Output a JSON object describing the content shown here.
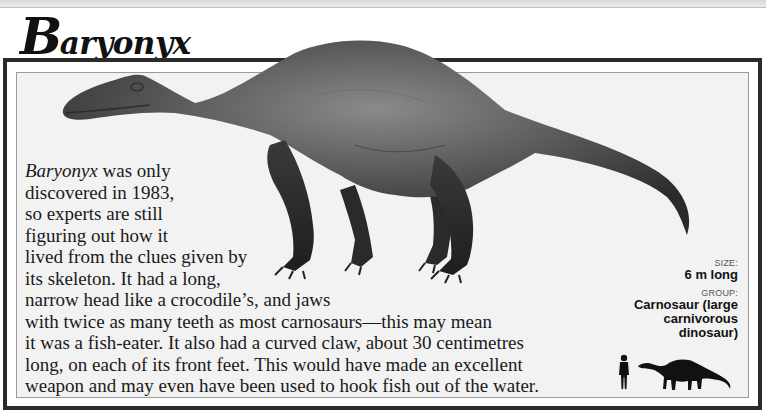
{
  "page": {
    "title_initial": "B",
    "title_rest": "aryonyx"
  },
  "body": {
    "lines": [
      {
        "italic": "Baryonyx",
        "text": " was only"
      },
      {
        "text": "discovered in 1983,"
      },
      {
        "text": "so experts are still"
      },
      {
        "text": "figuring out how it"
      },
      {
        "text": "lived from the clues given by"
      },
      {
        "text": "its skeleton. It had a long,"
      },
      {
        "text": "narrow head like a crocodile’s, and jaws"
      },
      {
        "text": "with twice as many teeth as most carnosaurs—this may mean"
      },
      {
        "text": "it was a fish-eater. It also had a curved claw, about 30 centimetres"
      },
      {
        "text": "long, on each of its front feet. This would have made an excellent"
      },
      {
        "text": "weapon and may even have been used to hook fish out of the water."
      }
    ]
  },
  "facts": {
    "size_label": "SIZE:",
    "size_value": "6 m long",
    "group_label": "GROUP:",
    "group_value_lines": [
      "Carnosaur (large",
      "carnivorous",
      "dinosaur)"
    ]
  },
  "illustrations": {
    "main": "baryonyx-illustration",
    "scale_human": "human-silhouette-icon",
    "scale_dino": "dinosaur-silhouette-icon"
  },
  "colors": {
    "frame": "#2b2b2b",
    "panel": "#f2f2f2",
    "text": "#1a1a1a"
  }
}
